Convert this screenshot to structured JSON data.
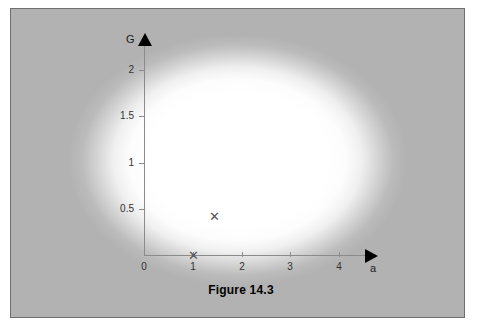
{
  "figure": {
    "caption": "Figure 14.3",
    "background_color": "#b2b2b2",
    "frame_color": "#6f6f6f",
    "axis_color": "#8b8b8b",
    "marker_color": "#555555",
    "marker_glyph": "✕"
  },
  "chart_data": {
    "type": "scatter",
    "title": "Figure 14.3",
    "xlabel": "a",
    "ylabel": "G",
    "xlim": [
      0,
      4.6
    ],
    "ylim": [
      0,
      2.25
    ],
    "grid": false,
    "legend": null,
    "x_ticks": [
      {
        "value": 0,
        "label": "0"
      },
      {
        "value": 1,
        "label": "1"
      },
      {
        "value": 2,
        "label": "2"
      },
      {
        "value": 3,
        "label": "3"
      },
      {
        "value": 4,
        "label": "4"
      }
    ],
    "y_ticks": [
      {
        "value": 0.5,
        "label": "0.5"
      },
      {
        "value": 1,
        "label": "1"
      },
      {
        "value": 1.5,
        "label": "1.5"
      },
      {
        "value": 2,
        "label": "2"
      }
    ],
    "origin_label": "0",
    "points": [
      {
        "x": 1.0,
        "y": 0.0,
        "marker": "x"
      },
      {
        "x": 1.45,
        "y": 0.42,
        "marker": "x"
      }
    ]
  }
}
